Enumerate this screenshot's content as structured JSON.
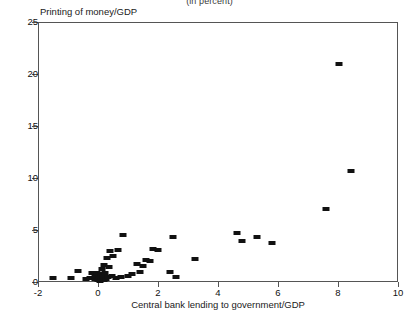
{
  "top_note": "(in percent)",
  "chart_data": {
    "type": "scatter",
    "title": "",
    "subtitle": "(in percent)",
    "xlabel": "Central bank lending to government/GDP",
    "ylabel": "Printing of money/GDP",
    "xlim": [
      -2,
      10
    ],
    "ylim": [
      0,
      25
    ],
    "xticks": [
      -2,
      0,
      2,
      4,
      6,
      8,
      10
    ],
    "yticks": [
      0,
      5,
      10,
      15,
      20,
      25
    ],
    "grid": false,
    "legend": null,
    "marker": {
      "shape": "rectangle",
      "color": "#111111"
    },
    "points": [
      {
        "x": -1.55,
        "y": 0.45
      },
      {
        "x": -0.95,
        "y": 0.45
      },
      {
        "x": -0.7,
        "y": 1.15
      },
      {
        "x": -0.45,
        "y": 0.4
      },
      {
        "x": -0.3,
        "y": 0.45
      },
      {
        "x": -0.22,
        "y": 0.95
      },
      {
        "x": -0.15,
        "y": 0.35
      },
      {
        "x": -0.12,
        "y": 0.75
      },
      {
        "x": -0.08,
        "y": 1.0
      },
      {
        "x": -0.05,
        "y": 0.3
      },
      {
        "x": 0.0,
        "y": 0.55
      },
      {
        "x": 0.02,
        "y": 0.2
      },
      {
        "x": 0.05,
        "y": 0.85
      },
      {
        "x": 0.08,
        "y": 0.3
      },
      {
        "x": 0.1,
        "y": 1.3
      },
      {
        "x": 0.12,
        "y": 0.6
      },
      {
        "x": 0.15,
        "y": 0.25
      },
      {
        "x": 0.18,
        "y": 1.7
      },
      {
        "x": 0.2,
        "y": 0.95
      },
      {
        "x": 0.22,
        "y": 0.4
      },
      {
        "x": 0.28,
        "y": 2.4
      },
      {
        "x": 0.3,
        "y": 0.55
      },
      {
        "x": 0.33,
        "y": 1.55
      },
      {
        "x": 0.38,
        "y": 3.1
      },
      {
        "x": 0.42,
        "y": 0.7
      },
      {
        "x": 0.48,
        "y": 2.55
      },
      {
        "x": 0.55,
        "y": 0.45
      },
      {
        "x": 0.62,
        "y": 3.15
      },
      {
        "x": 0.72,
        "y": 0.6
      },
      {
        "x": 0.8,
        "y": 4.6
      },
      {
        "x": 0.95,
        "y": 0.7
      },
      {
        "x": 1.1,
        "y": 0.85
      },
      {
        "x": 1.25,
        "y": 1.85
      },
      {
        "x": 1.35,
        "y": 1.05
      },
      {
        "x": 1.45,
        "y": 1.6
      },
      {
        "x": 1.55,
        "y": 2.25
      },
      {
        "x": 1.7,
        "y": 2.1
      },
      {
        "x": 1.8,
        "y": 3.25
      },
      {
        "x": 1.95,
        "y": 3.2
      },
      {
        "x": 2.35,
        "y": 1.05
      },
      {
        "x": 2.45,
        "y": 4.45
      },
      {
        "x": 2.55,
        "y": 0.55
      },
      {
        "x": 3.2,
        "y": 2.3
      },
      {
        "x": 4.6,
        "y": 4.8
      },
      {
        "x": 4.75,
        "y": 4.05
      },
      {
        "x": 5.25,
        "y": 4.45
      },
      {
        "x": 5.75,
        "y": 3.8
      },
      {
        "x": 7.55,
        "y": 7.1
      },
      {
        "x": 8.0,
        "y": 21.05
      },
      {
        "x": 8.4,
        "y": 10.75
      }
    ]
  }
}
